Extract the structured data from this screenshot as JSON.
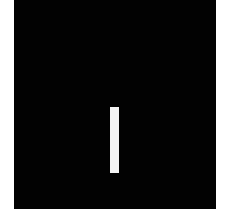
{
  "image": {
    "description": "Black square on white background with a single white vertical bar",
    "colors": {
      "background": "#ffffff",
      "square": "#020202",
      "bar": "#f4f4f4"
    }
  }
}
